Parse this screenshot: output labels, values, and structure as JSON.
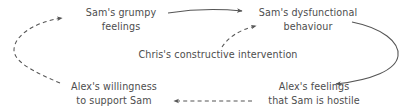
{
  "diagram": {
    "background_color": "#ffffff",
    "text_color": "#4d4d4d",
    "line_color": "#555555",
    "nodes": [
      {
        "id": "sam-feelings",
        "lines": [
          "Sam's grumpy",
          "feelings"
        ],
        "align": "center"
      },
      {
        "id": "sam-behaviour",
        "lines": [
          "Sam's dysfunctional",
          "behaviour"
        ],
        "align": "center"
      },
      {
        "id": "chris-intervention",
        "lines": [
          "Chris's constructive intervention"
        ],
        "align": "center"
      },
      {
        "id": "alex-willingness",
        "lines": [
          "Alex's willingness",
          "to support Sam"
        ],
        "align": "center"
      },
      {
        "id": "alex-hostile",
        "lines": [
          "Alex's feelings",
          "that Sam is hostile"
        ],
        "align": "center"
      }
    ],
    "edges": [
      {
        "id": "feelings-to-behaviour",
        "from": "sam-feelings",
        "to": "sam-behaviour",
        "style": "solid",
        "label": ""
      },
      {
        "id": "behaviour-to-hostile",
        "from": "sam-behaviour",
        "to": "alex-hostile",
        "style": "solid",
        "label": ""
      },
      {
        "id": "hostile-to-willingness",
        "from": "alex-hostile",
        "to": "alex-willingness",
        "style": "dashed",
        "label": ""
      },
      {
        "id": "willingness-to-feelings",
        "from": "alex-willingness",
        "to": "sam-feelings",
        "style": "dashed",
        "label": ""
      },
      {
        "id": "intervention-to-behaviour",
        "from": "chris-intervention",
        "to": "sam-behaviour",
        "style": "dashed",
        "label": ""
      }
    ]
  }
}
